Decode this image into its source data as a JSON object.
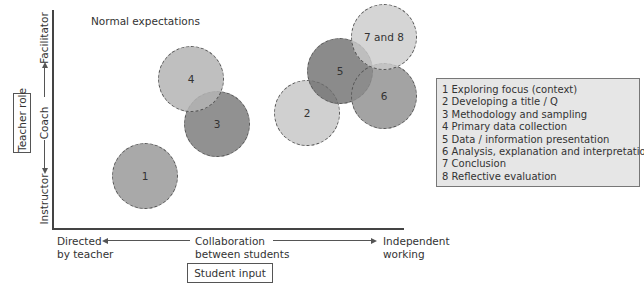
{
  "title": "Normal expectations",
  "y_axis": {
    "box_label": "Teacher role",
    "low": "Instructor",
    "mid": "Coach",
    "high": "Facilitator"
  },
  "x_axis": {
    "box_label": "Student input",
    "low": [
      "Directed",
      "by teacher"
    ],
    "mid": [
      "Collaboration",
      "between students"
    ],
    "high": [
      "Independent",
      "working"
    ]
  },
  "circles": [
    {
      "label": "1",
      "cx": 145,
      "cy": 176,
      "color": "#a0a0a0",
      "opacity": 0.9
    },
    {
      "label": "2",
      "cx": 307,
      "cy": 113,
      "color": "#c8c8c8",
      "opacity": 0.85
    },
    {
      "label": "3",
      "cx": 217,
      "cy": 124,
      "color": "#7e7e7e",
      "opacity": 0.85
    },
    {
      "label": "4",
      "cx": 191,
      "cy": 79,
      "color": "#b4b4b4",
      "opacity": 0.85
    },
    {
      "label": "5",
      "cx": 340,
      "cy": 71,
      "color": "#6e6e6e",
      "opacity": 0.8
    },
    {
      "label": "6",
      "cx": 384,
      "cy": 96,
      "color": "#8c8c8c",
      "opacity": 0.8
    },
    {
      "label": "7 and 8",
      "cx": 384,
      "cy": 37,
      "color": "#cacaca",
      "opacity": 0.8
    }
  ],
  "legend": [
    "1 Exploring focus (context)",
    "2 Developing a title / Q",
    "3 Methodology and sampling",
    "4 Primary data collection",
    "5 Data / information presentation",
    "6 Analysis, explanation and interpretation",
    "7 Conclusion",
    "8 Reflective evaluation"
  ]
}
